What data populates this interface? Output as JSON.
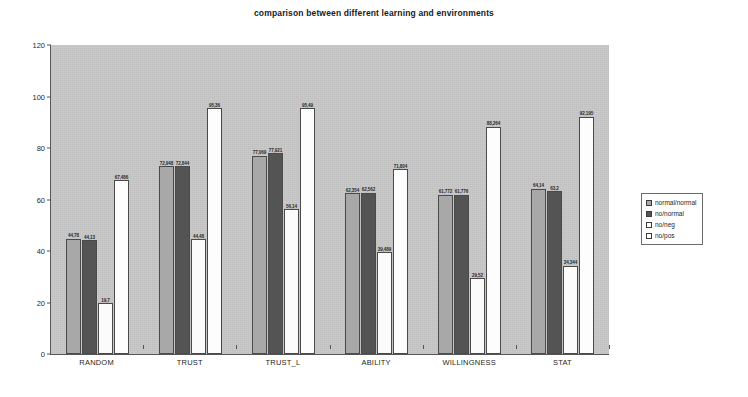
{
  "chart_data": {
    "type": "bar",
    "title": "comparison between different learning and environments",
    "xlabel": "",
    "ylabel": "",
    "ylim": [
      0,
      120
    ],
    "yticks": [
      0,
      20,
      40,
      60,
      80,
      100,
      120
    ],
    "grid": false,
    "legend_position": "right",
    "categories": [
      "RANDOM",
      "TRUST",
      "TRUST_L",
      "ABILITY",
      "WILLINGNESS",
      "STAT"
    ],
    "series": [
      {
        "name": "normal/normal",
        "color": "#a8a8a8",
        "values": [
          44.78,
          72.948,
          77.069,
          62.354,
          61.772,
          64.14
        ],
        "labels": [
          "44,78",
          "72,948",
          "77,069",
          "62,354",
          "61,772",
          "64,14"
        ]
      },
      {
        "name": "no/normal",
        "color": "#545454",
        "values": [
          44.13,
          72.844,
          77.921,
          62.562,
          61.776,
          63.2
        ],
        "labels": [
          "44,13",
          "72,844",
          "77,921",
          "62,562",
          "61,776",
          "63,2"
        ]
      },
      {
        "name": "no/neg",
        "color": "#ffffff",
        "values": [
          19.7,
          44.48,
          56.14,
          39.489,
          29.52,
          34.344
        ],
        "labels": [
          "19,7",
          "44,48",
          "56,14",
          "39,489",
          "29,52",
          "34,344"
        ]
      },
      {
        "name": "no/pos",
        "color": "#ffffff",
        "values": [
          67.486,
          95.36,
          95.49,
          71.804,
          88.264,
          92.195
        ],
        "labels": [
          "67,486",
          "95,36",
          "95,49",
          "71,804",
          "88,264",
          "92,195"
        ]
      }
    ]
  },
  "legend": {
    "items": [
      {
        "label": "normal/normal"
      },
      {
        "label": "no/normal"
      },
      {
        "label": "no/neg"
      },
      {
        "label": "no/pos"
      }
    ]
  }
}
